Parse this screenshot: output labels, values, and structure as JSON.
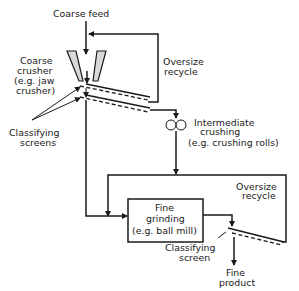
{
  "diagram": {
    "type": "process-flow",
    "labels": {
      "coarse_feed": "Coarse feed",
      "coarse_crusher": [
        "Coarse",
        "crusher",
        "(e.g. jaw",
        "crusher)"
      ],
      "classifying_screens": [
        "Classifying",
        "screens"
      ],
      "oversize_recycle_1": [
        "Oversize",
        "recycle"
      ],
      "intermediate_crushing": [
        "Intermediate",
        "crushing",
        "(e.g. crushing rolls)"
      ],
      "oversize_recycle_2": [
        "Oversize",
        "recycle"
      ],
      "fine_grinding": [
        "Fine",
        "grinding",
        "(e.g. ball mill)"
      ],
      "classifying_screen": [
        "Classifying",
        "screen"
      ],
      "fine_product": [
        "Fine",
        "product"
      ]
    },
    "colors": {
      "line": "#1a1a1a",
      "crusher_fill": "#d9d9d9",
      "background": "#ffffff"
    }
  }
}
